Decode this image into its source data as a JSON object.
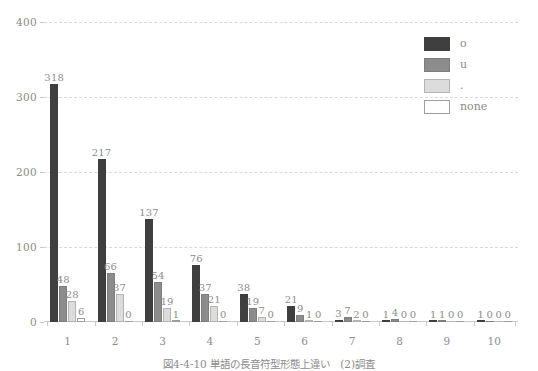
{
  "chart_data": {
    "type": "bar",
    "title": "",
    "subtitle": "",
    "xlabel": "",
    "ylabel": "",
    "categories": [
      "1",
      "2",
      "3",
      "4",
      "5",
      "6",
      "7",
      "8",
      "9",
      "10"
    ],
    "series": [
      {
        "name": "o",
        "color": "#3f3f3f",
        "values": [
          318,
          217,
          137,
          76,
          38,
          21,
          3,
          1,
          1,
          1
        ]
      },
      {
        "name": "u",
        "color": "#8c8c8c",
        "values": [
          48,
          66,
          54,
          37,
          19,
          9,
          7,
          4,
          1,
          0
        ]
      },
      {
        "name": ".",
        "color": "#dcdcdc",
        "values": [
          28,
          37,
          19,
          21,
          7,
          1,
          2,
          0,
          0,
          0
        ]
      },
      {
        "name": "none",
        "color": "#ffffff",
        "values": [
          6,
          0,
          1,
          0,
          0,
          0,
          0,
          0,
          0,
          0
        ]
      }
    ],
    "yticks": [
      0,
      100,
      200,
      300,
      400
    ],
    "ylim": [
      0,
      400
    ],
    "grid": true,
    "grid_style": "dashed",
    "legend_position": "top-right",
    "data_labels": true
  },
  "legend": {
    "entries": [
      {
        "label": "o"
      },
      {
        "label": "u"
      },
      {
        "label": "."
      },
      {
        "label": "none"
      }
    ]
  },
  "caption": {
    "text": "図4-4-10  単語の長音符型形態上違い　(2)調査"
  }
}
